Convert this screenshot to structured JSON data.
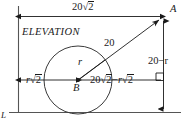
{
  "figure": {
    "title": "ELEVATION",
    "kind": "geometry-diagram",
    "stroke_color": "#1a1a1a",
    "background_color": "#ffffff"
  },
  "labels": {
    "elevation": "ELEVATION",
    "top_dimension": "20√2",
    "point_a": "A",
    "hypotenuse": "20",
    "radius": "r",
    "point_b": "B",
    "left_segment": "r√2",
    "right_segment": "20√2−r√2",
    "vertical_dimension": "20−r",
    "ground_line": "L"
  },
  "parts": {
    "top_dimension_prefix": "20",
    "top_dimension_radicand": "2",
    "left_segment_prefix": "r",
    "left_segment_radicand": "2",
    "right_segment_a_prefix": "20",
    "right_segment_a_radicand": "2",
    "right_segment_minus": "−",
    "right_segment_b_prefix": "r",
    "right_segment_b_radicand": "2",
    "vertical_dimension_value": "20−r"
  },
  "geometry": {
    "left_wall_x": 18,
    "ground_y": 112,
    "point_a": {
      "x": 163,
      "y": 18
    },
    "point_b": {
      "x": 78,
      "y": 80
    },
    "circle_radius": 34,
    "top_dimension_y": 16,
    "center_line_y": 80,
    "right_dimension_x": 163,
    "chord_20": "20",
    "right_angle_marker": true
  }
}
